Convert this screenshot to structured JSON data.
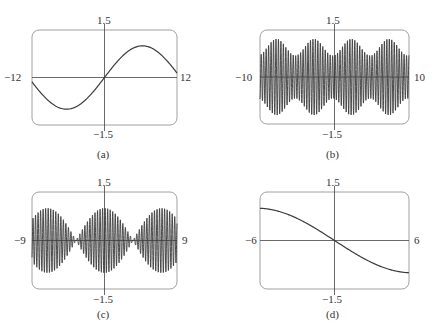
{
  "chart_data": [
    {
      "id": "a",
      "type": "line",
      "caption": "(a)",
      "function_shape": "single slow sine wave",
      "xlim": [
        -12,
        12
      ],
      "ylim": [
        -1.5,
        1.5
      ],
      "x_tick_labels": {
        "left": "−12",
        "right": "12"
      },
      "y_tick_labels": {
        "top": "1.5",
        "bottom": "−1.5"
      },
      "series": [
        {
          "name": "y",
          "formula": "sin(x/4)",
          "amp": 1.0,
          "freq": 0.25,
          "env": 0,
          "sign": 1
        }
      ],
      "box": {
        "x": 32,
        "y": 30,
        "w": 145,
        "h": 95
      }
    },
    {
      "id": "b",
      "type": "line",
      "caption": "(b)",
      "function_shape": "fast oscillation with slowly varying amplitude",
      "xlim": [
        -10,
        10
      ],
      "ylim": [
        -1.5,
        1.5
      ],
      "x_tick_labels": {
        "left": "−10",
        "right": "10"
      },
      "y_tick_labels": {
        "top": "1.5",
        "bottom": "−1.5"
      },
      "series": [
        {
          "name": "y",
          "formula": "sin(19x) * (1 - 0.25 cos(1.2x)) approx",
          "amp": 1.0,
          "freq": 19,
          "env": 2,
          "sign": 1
        }
      ],
      "box": {
        "x": 260,
        "y": 30,
        "w": 149,
        "h": 94
      }
    },
    {
      "id": "c",
      "type": "line",
      "caption": "(c)",
      "function_shape": "beat pattern: fast oscillation with cosine envelope",
      "xlim": [
        -9,
        9
      ],
      "ylim": [
        -1.5,
        1.5
      ],
      "x_tick_labels": {
        "left": "−9",
        "right": "9"
      },
      "y_tick_labels": {
        "top": "1.5",
        "bottom": "−1.5"
      },
      "series": [
        {
          "name": "y",
          "formula": "cos(x/2) * sin(20x) approx",
          "amp": 1.0,
          "freq": 20,
          "env": 1,
          "sign": 1
        }
      ],
      "box": {
        "x": 32,
        "y": 192,
        "w": 145,
        "h": 97
      }
    },
    {
      "id": "d",
      "type": "line",
      "caption": "(d)",
      "function_shape": "decreasing smooth curve through origin",
      "xlim": [
        -6,
        6
      ],
      "ylim": [
        -1.5,
        1.5
      ],
      "x_tick_labels": {
        "left": "−6",
        "right": "6"
      },
      "y_tick_labels": {
        "top": "1.5",
        "bottom": "−1.5"
      },
      "series": [
        {
          "name": "y",
          "formula": "-sin(x/4)",
          "amp": 1.0,
          "freq": 0.25,
          "env": 0,
          "sign": -1
        }
      ],
      "box": {
        "x": 260,
        "y": 192,
        "w": 149,
        "h": 97
      }
    }
  ],
  "panels": {
    "a": {
      "top": "1.5",
      "bottom": "−1.5",
      "left": "−12",
      "right": "12",
      "caption": "(a)"
    },
    "b": {
      "top": "1.5",
      "bottom": "−1.5",
      "left": "−10",
      "right": "10",
      "caption": "(b)"
    },
    "c": {
      "top": "1.5",
      "bottom": "−1.5",
      "left": "−9",
      "right": "9",
      "caption": "(c)"
    },
    "d": {
      "top": "1.5",
      "bottom": "−1.5",
      "left": "−6",
      "right": "6",
      "caption": "(d)"
    }
  },
  "colors": {
    "frame": "#a0a0a0",
    "axis": "#444444",
    "curve": "#3a3a3a"
  }
}
